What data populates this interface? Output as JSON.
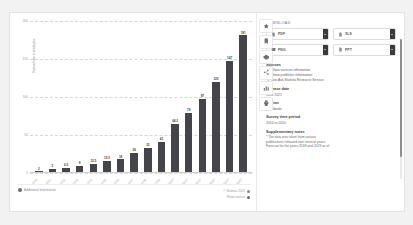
{
  "chart_data": {
    "type": "bar",
    "title": "",
    "xlabel": "",
    "ylabel": "Data volume in zettabytes",
    "ylim": [
      0,
      200
    ],
    "yticks": [
      0,
      50,
      100,
      150,
      200
    ],
    "ytick_labels": [
      "0",
      "50",
      "100",
      "150",
      "200"
    ],
    "grid": true,
    "legend": "none",
    "categories": [
      "2010",
      "2011",
      "2012",
      "2013",
      "2014",
      "2015",
      "2016",
      "2017",
      "2018",
      "2019",
      "2020*",
      "2021*",
      "2022*",
      "2023*",
      "2024*",
      "2025*"
    ],
    "values": [
      2,
      5,
      6.5,
      9,
      12.5,
      15.5,
      18,
      26,
      33,
      41,
      64.2,
      79,
      97,
      120,
      147,
      181
    ],
    "value_labels": [
      "2",
      "5",
      "6.5",
      "9",
      "12.5",
      "15.5",
      "18",
      "26",
      "33",
      "41",
      "64.2",
      "79",
      "97",
      "120",
      "147",
      "181"
    ],
    "bar_color": "#44454a"
  },
  "chart_footer": {
    "additional_information": "Additional Information",
    "copyright": "© Statista 2022",
    "show_source": "Show source"
  },
  "icon_rail": {
    "items": [
      {
        "name": "star-icon",
        "title": "Favorite"
      },
      {
        "name": "bookmark-icon",
        "title": "Bookmark"
      },
      {
        "name": "gear-icon",
        "title": "Settings"
      },
      {
        "name": "share-icon",
        "title": "Share"
      },
      {
        "name": "chart-icon",
        "title": "Chart type"
      },
      {
        "name": "print-icon",
        "title": "Print"
      }
    ]
  },
  "download": {
    "title": "DOWNLOAD",
    "buttons": [
      {
        "label": "PDF",
        "icon": "pdf-icon"
      },
      {
        "label": "XLS",
        "icon": "xls-icon"
      },
      {
        "label": "PNG",
        "icon": "png-icon"
      },
      {
        "label": "PPT",
        "icon": "ppt-icon"
      }
    ]
  },
  "sources": {
    "heading": "Sources",
    "links": [
      "Show sources information",
      "Show publisher information",
      "Use Ask Statista Research Service"
    ]
  },
  "release_date": {
    "heading": "Release date",
    "value": "June 2021"
  },
  "region": {
    "heading": "Region",
    "value": "Worldwide"
  },
  "survey_period": {
    "heading": "Survey time period",
    "value": "2010 to 2020"
  },
  "supplementary": {
    "heading": "Supplementary notes",
    "lines": [
      "* The data was taken from various",
      "publications released over several years.",
      "Forecast for the years 2018 and 2019 as of"
    ]
  },
  "colors": {
    "bar": "#44454a",
    "panel_bg": "#ffffff",
    "page_bg": "#f2f2f2",
    "caret_bg": "#3a3a3a"
  }
}
